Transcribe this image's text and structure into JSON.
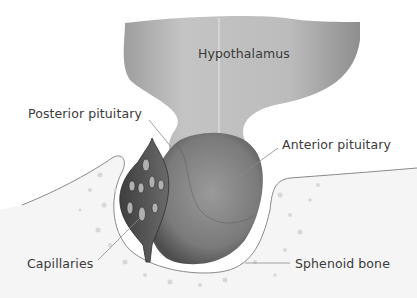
{
  "diagram": {
    "labels": {
      "hypothalamus": "Hypothalamus",
      "posterior_pituitary": "Posterior pituitary",
      "anterior_pituitary": "Anterior pituitary",
      "capillaries": "Capillaries",
      "sphenoid_bone": "Sphenoid bone"
    },
    "colors": {
      "tissue_light": "#bdbdbd",
      "tissue_dark": "#6e6e6e",
      "capillary_dark": "#4a4a4a",
      "bone_fill": "#f4f4f4",
      "outline": "#8a8a8a",
      "text": "#3a3a3a"
    }
  }
}
